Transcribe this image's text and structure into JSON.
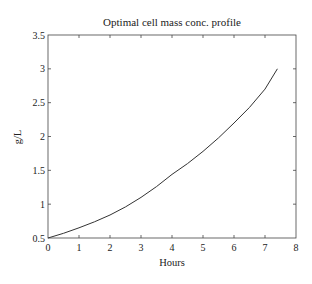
{
  "chart_data": {
    "type": "line",
    "title": "Optimal cell mass conc. profile",
    "xlabel": "Hours",
    "ylabel": "g/L",
    "xlim": [
      0,
      8
    ],
    "ylim": [
      0.5,
      3.5
    ],
    "xticks": [
      "0",
      "1",
      "2",
      "3",
      "4",
      "5",
      "6",
      "7",
      "8"
    ],
    "yticks": [
      "0.5",
      "1",
      "1.5",
      "2",
      "2.5",
      "3",
      "3.5"
    ],
    "grid": false,
    "legend": null,
    "series": [
      {
        "name": "cell mass concentration",
        "color": "#333333",
        "x": [
          0,
          0.5,
          1,
          1.5,
          2,
          2.5,
          3,
          3.5,
          4,
          4.5,
          5,
          5.5,
          6,
          6.5,
          7,
          7.4
        ],
        "y": [
          0.5,
          0.57,
          0.65,
          0.74,
          0.84,
          0.96,
          1.1,
          1.26,
          1.44,
          1.6,
          1.78,
          1.98,
          2.2,
          2.43,
          2.7,
          3.0
        ]
      }
    ]
  }
}
